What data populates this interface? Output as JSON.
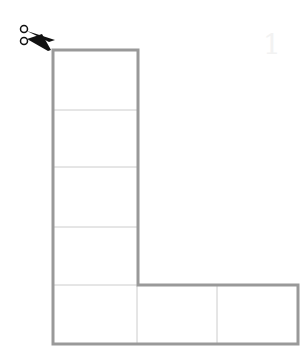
{
  "diagram": {
    "icon": "scissors-icon",
    "watermark_text": "1",
    "colors": {
      "outline": "#999999",
      "inner_lines": "#cccccc",
      "scissors": "#111111",
      "background": "#ffffff"
    },
    "column": {
      "cells": 5,
      "x": [
        53,
        137
      ],
      "row_lines_y": [
        50,
        110,
        167,
        227,
        285,
        344
      ]
    },
    "foot": {
      "cells": 3,
      "x_lines": [
        53,
        137,
        217,
        298
      ],
      "y": [
        285,
        344
      ]
    }
  }
}
